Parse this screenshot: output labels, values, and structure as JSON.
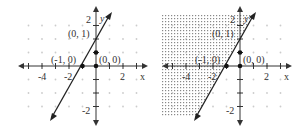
{
  "graphs": [
    {
      "id": "left",
      "shaded": false,
      "x_axis_label": "x",
      "y_axis_label": "y",
      "x_tick_labels": [
        "-4",
        "-2",
        "2"
      ],
      "y_tick_labels": [
        "2",
        "-2"
      ],
      "points": [
        {
          "label": "(0, 1)",
          "x": 0,
          "y": 1
        },
        {
          "label": "(-1, 0)",
          "x": -1,
          "y": 0
        },
        {
          "label": "(0, 0)",
          "x": 0,
          "y": 0
        }
      ],
      "line": "y = x + 1"
    },
    {
      "id": "right",
      "shaded": true,
      "shade_region": "left of line (y > x + 1)",
      "x_axis_label": "x",
      "y_axis_label": "y",
      "x_tick_labels": [
        "-4",
        "-2",
        "2"
      ],
      "y_tick_labels": [
        "2",
        "-2"
      ],
      "points": [
        {
          "label": "(0, 1)",
          "x": 0,
          "y": 1
        },
        {
          "label": "(-1, 0)",
          "x": -1,
          "y": 0
        },
        {
          "label": "(0, 0)",
          "x": 0,
          "y": 0
        }
      ],
      "line": "y = x + 1"
    }
  ],
  "colors": {
    "axis": "#333333",
    "grid_dot": "#cccccc",
    "shade": "#999999"
  }
}
